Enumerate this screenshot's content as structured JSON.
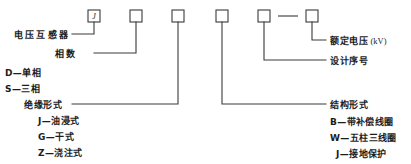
{
  "diagram": {
    "type": "model-designation-breakdown",
    "stroke_color": "#3a3a3a",
    "background_color": "#ffffff",
    "boxes": [
      {
        "id": "box-1",
        "letter": "J",
        "x": 88,
        "y": 10,
        "w": 12,
        "h": 12
      },
      {
        "id": "box-2",
        "letter": "",
        "x": 130,
        "y": 10,
        "w": 12,
        "h": 12
      },
      {
        "id": "box-3",
        "letter": "",
        "x": 172,
        "y": 10,
        "w": 12,
        "h": 12
      },
      {
        "id": "box-4",
        "letter": "",
        "x": 216,
        "y": 10,
        "w": 12,
        "h": 12
      },
      {
        "id": "box-5",
        "letter": "",
        "x": 258,
        "y": 10,
        "w": 12,
        "h": 12
      },
      {
        "id": "box-6",
        "letter": "",
        "x": 306,
        "y": 10,
        "w": 12,
        "h": 12
      }
    ],
    "separator_dash": {
      "x1": 278,
      "y1": 16,
      "x2": 298,
      "y2": 16
    },
    "left_labels": [
      {
        "id": "label-voltage-transformer",
        "text": "电压互感器",
        "x": 14,
        "y": 31,
        "spaced": true
      },
      {
        "id": "label-phase-count",
        "text": "相数",
        "x": 55,
        "y": 50,
        "spaced": true
      },
      {
        "id": "label-single-phase",
        "text": "D—单相",
        "x": 5,
        "y": 69,
        "spaced": false
      },
      {
        "id": "label-three-phase",
        "text": "S—三相",
        "x": 5,
        "y": 85,
        "spaced": false
      },
      {
        "id": "label-insulation-type",
        "text": "绝缘形式",
        "x": 24,
        "y": 101,
        "spaced": false
      },
      {
        "id": "label-oil-immersed",
        "text": "J—油浸式",
        "x": 38,
        "y": 117,
        "spaced": false
      },
      {
        "id": "label-dry-type",
        "text": "G—干式",
        "x": 38,
        "y": 133,
        "spaced": false
      },
      {
        "id": "label-cast-type",
        "text": "Z—浇注式",
        "x": 38,
        "y": 149,
        "spaced": false
      }
    ],
    "right_labels": [
      {
        "id": "label-rated-voltage",
        "text": "额定电压",
        "unit": "(kV)",
        "x": 330,
        "y": 37
      },
      {
        "id": "label-design-serial",
        "text": "设计序号",
        "unit": "",
        "x": 330,
        "y": 57
      },
      {
        "id": "label-structure-type",
        "text": "结构形式",
        "unit": "",
        "x": 330,
        "y": 101
      },
      {
        "id": "label-compensating-coil",
        "text": "B—带补偿线圈",
        "unit": "",
        "x": 330,
        "y": 118
      },
      {
        "id": "label-five-limb-coil",
        "text": "W—五柱三线圈",
        "unit": "",
        "x": 330,
        "y": 134
      },
      {
        "id": "label-ground-protection",
        "text": "J—接地保护",
        "unit": "",
        "x": 336,
        "y": 150
      }
    ],
    "leader_lines": [
      {
        "id": "leader-box1-to-voltage-transformer",
        "points": "94,22 94,34 72,34"
      },
      {
        "id": "leader-box2-to-phase-count",
        "points": "136,22 136,53 94,53"
      },
      {
        "id": "leader-box3-to-insulation-type",
        "points": "178,22 178,104 72,104"
      },
      {
        "id": "leader-box4-to-structure-type",
        "points": "222,22 222,104 326,104"
      },
      {
        "id": "leader-box5-to-design-serial",
        "points": "264,22 264,60 326,60"
      },
      {
        "id": "leader-box6-to-rated-voltage",
        "points": "312,22 312,40 326,40"
      }
    ]
  }
}
